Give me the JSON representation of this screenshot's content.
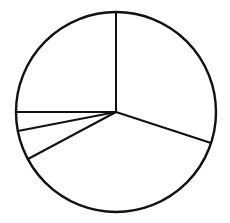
{
  "figure": {
    "name": "pie-chart-figure",
    "background_color": "#ffffff",
    "width": 230,
    "height": 223
  },
  "chart_data": {
    "type": "pie",
    "title": "",
    "subtitle": "",
    "xlabel": "",
    "ylabel": "",
    "legend": [],
    "legend_position": "none",
    "grid": false,
    "labels_visible": false,
    "value_labels": [],
    "categories": [
      "Slice 1",
      "Slice 2",
      "Slice 3",
      "Slice 4",
      "Slice 5"
    ],
    "values": [
      90,
      11,
      17,
      134,
      108
    ],
    "units": "degrees",
    "percentages": [
      25.0,
      3.1,
      4.7,
      37.2,
      30.0
    ],
    "start_angle_deg": 0,
    "direction": "clockwise",
    "boundary_angles_deg": [
      0,
      90,
      101,
      118,
      252,
      360
    ],
    "center": {
      "x": 116,
      "y": 112
    },
    "radius": 100,
    "slice_fill": "#ffffff",
    "stroke_color": "#111111",
    "stroke_width": 2,
    "outline_stroke_width": 2.4
  },
  "geometry": {
    "outline_circle": {
      "cx": 116,
      "cy": 112,
      "r": 100
    },
    "dividers": [
      {
        "name": "divider-up",
        "angle_deg": 0,
        "x2": 116,
        "y2": 12
      },
      {
        "name": "divider-left",
        "angle_deg": 90,
        "x2": 16,
        "y2": 112
      },
      {
        "name": "divider-left-lower1",
        "angle_deg": 101,
        "x2": 18,
        "y2": 131
      },
      {
        "name": "divider-left-lower2",
        "angle_deg": 118,
        "x2": 28,
        "y2": 159
      },
      {
        "name": "divider-right-lower",
        "angle_deg": 252,
        "x2": 211,
        "y2": 143
      }
    ]
  }
}
